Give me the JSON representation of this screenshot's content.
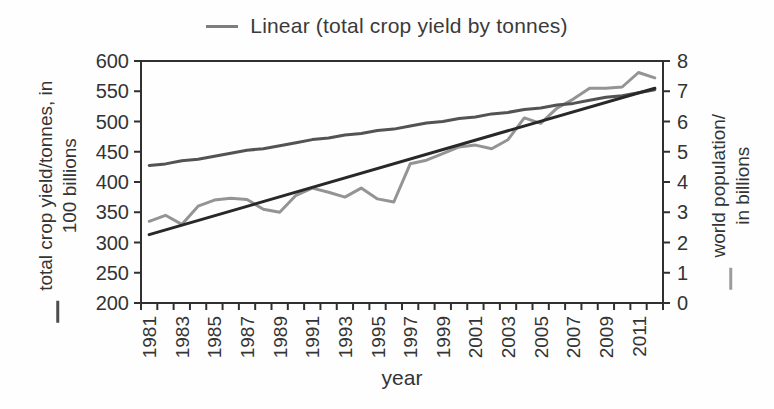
{
  "legend": {
    "label": "Linear (total crop yield by tonnes)",
    "marker_color": "#7d7d7d"
  },
  "left_axis_title": {
    "line1": "total crop yield/tonnes, in",
    "line2": "100 billions",
    "marker_color": "#4d4d4d"
  },
  "right_axis_title": {
    "line1": "world population/",
    "line2": "in billions",
    "marker_color": "#9c9c9c"
  },
  "chart_data": {
    "type": "line",
    "xlabel": "year",
    "x": [
      1981,
      1982,
      1983,
      1984,
      1985,
      1986,
      1987,
      1988,
      1989,
      1990,
      1991,
      1992,
      1993,
      1994,
      1995,
      1996,
      1997,
      1998,
      1999,
      2000,
      2001,
      2002,
      2003,
      2004,
      2005,
      2006,
      2007,
      2008,
      2009,
      2010,
      2011,
      2012
    ],
    "x_tick_labels": [
      "1981",
      "1983",
      "1985",
      "1987",
      "1989",
      "1991",
      "1993",
      "1995",
      "1997",
      "1999",
      "2001",
      "2003",
      "2005",
      "2007",
      "2009",
      "2011"
    ],
    "left_axis": {
      "min": 200,
      "max": 600,
      "ticks": [
        600,
        550,
        500,
        450,
        400,
        350,
        300,
        250,
        200
      ]
    },
    "right_axis": {
      "min": 0,
      "max": 8,
      "ticks": [
        8,
        7,
        6,
        5,
        4,
        3,
        2,
        1,
        0
      ]
    },
    "grid": false,
    "legend_position": "top-center",
    "series": [
      {
        "name": "total crop yield by tonnes",
        "axis": "left",
        "color": "#949494",
        "values": [
          335,
          345,
          330,
          360,
          370,
          373,
          371,
          355,
          350,
          378,
          390,
          383,
          375,
          390,
          372,
          367,
          430,
          436,
          447,
          458,
          461,
          455,
          470,
          506,
          497,
          522,
          537,
          555,
          555,
          557,
          581,
          572
        ]
      },
      {
        "name": "world population",
        "axis": "right",
        "color": "#535353",
        "values": [
          4.55,
          4.6,
          4.7,
          4.75,
          4.85,
          4.95,
          5.05,
          5.1,
          5.2,
          5.3,
          5.4,
          5.45,
          5.55,
          5.6,
          5.7,
          5.75,
          5.85,
          5.95,
          6.0,
          6.1,
          6.15,
          6.25,
          6.3,
          6.4,
          6.45,
          6.55,
          6.6,
          6.7,
          6.8,
          6.85,
          6.95,
          7.05
        ]
      },
      {
        "name": "Linear (total crop yield by tonnes)",
        "axis": "left",
        "color": "#282828",
        "trend": {
          "start": 313,
          "end": 555
        }
      }
    ]
  }
}
